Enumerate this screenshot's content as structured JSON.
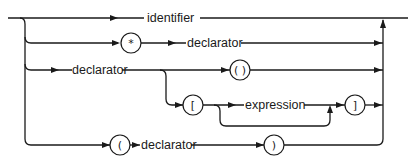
{
  "diagram": {
    "type": "syntax-railroad",
    "nonterminals": {
      "identifier": "identifier",
      "declarator_star": "declarator",
      "declarator_func": "declarator",
      "expression": "expression",
      "declarator_paren": "declarator"
    },
    "terminals": {
      "star": "*",
      "func_parens": "( )",
      "lbracket": "[",
      "rbracket": "]",
      "lparen": "(",
      "rparen": ")"
    },
    "paths": [
      [
        "identifier"
      ],
      [
        "*",
        "declarator"
      ],
      [
        "declarator",
        "( )"
      ],
      [
        "declarator",
        "[",
        "expression (optional)",
        "]"
      ],
      [
        "(",
        "declarator",
        ")"
      ]
    ],
    "colors": {
      "stroke": "#1a1a1a",
      "background": "#ffffff"
    }
  }
}
